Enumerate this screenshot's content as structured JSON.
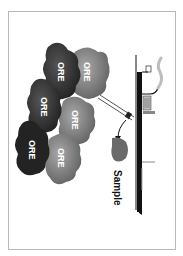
{
  "diagram": {
    "orientation": "rotated 90deg clockwise",
    "ore_bodies": [
      {
        "label": "ORE",
        "shade": "dark",
        "color": "#3a3a3a"
      },
      {
        "label": "ORE",
        "shade": "medium",
        "color": "#8a8a8a"
      },
      {
        "label": "ORE",
        "shade": "dark",
        "color": "#2e2e2e"
      },
      {
        "label": "ORE",
        "shade": "medium",
        "color": "#7a7a7a"
      },
      {
        "label": "ORE",
        "shade": "darkest",
        "color": "#222222"
      },
      {
        "label": "ORE",
        "shade": "medium",
        "color": "#6e6e6e"
      }
    ],
    "sample": {
      "label": "Sample",
      "color": "#6a6a6a"
    },
    "structures": {
      "ground_surface": "ground line",
      "drill_rig": "drilling rig with smoke",
      "drill_hole": "inclined drill hole into ore"
    },
    "colors": {
      "frame": "#b8b8b8",
      "ground": "#111111",
      "drill_hole": "#555555"
    }
  }
}
